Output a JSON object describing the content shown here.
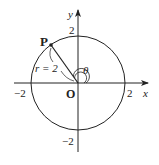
{
  "diagram": {
    "type": "polar-coordinate unit circle",
    "origin": {
      "label": "O"
    },
    "axes": {
      "x": {
        "label": "x",
        "ticks": [
          {
            "value": -2,
            "label": "−2"
          },
          {
            "value": 2,
            "label": "2"
          }
        ]
      },
      "y": {
        "label": "y",
        "ticks": [
          {
            "value": 2,
            "label": "2"
          },
          {
            "value": -2,
            "label": "−2"
          }
        ]
      }
    },
    "circle": {
      "radius": 2
    },
    "point": {
      "label": "P",
      "angle_deg": 125
    },
    "radius_label": "r = 2",
    "angle_label": "θ",
    "colors": {
      "stroke": "#222222",
      "background": "#ffffff"
    }
  }
}
